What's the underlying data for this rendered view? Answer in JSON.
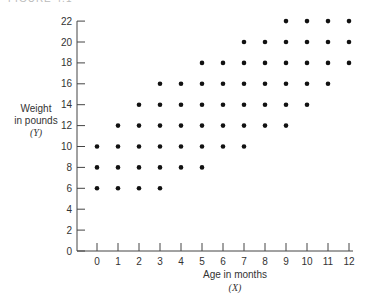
{
  "figure_label": "FIGURE 4.1",
  "chart_data": {
    "type": "scatter",
    "title": "",
    "xlabel": "Age in months",
    "xlabel_var": "(X)",
    "ylabel_lines": [
      "Weight",
      "in pounds",
      "(Y)"
    ],
    "x_ticks": [
      0,
      1,
      2,
      3,
      4,
      5,
      6,
      7,
      8,
      9,
      10,
      11,
      12
    ],
    "y_ticks": [
      0,
      2,
      4,
      6,
      8,
      10,
      12,
      14,
      16,
      18,
      20,
      22
    ],
    "xlim": [
      0,
      12
    ],
    "ylim": [
      0,
      22
    ],
    "grid": false,
    "legend": null,
    "columns": [
      {
        "x": 0,
        "y": [
          6,
          8,
          10
        ]
      },
      {
        "x": 1,
        "y": [
          6,
          8,
          10,
          12
        ]
      },
      {
        "x": 2,
        "y": [
          6,
          8,
          10,
          12,
          14
        ]
      },
      {
        "x": 3,
        "y": [
          6,
          8,
          10,
          12,
          14,
          16
        ]
      },
      {
        "x": 4,
        "y": [
          8,
          10,
          12,
          14,
          16
        ]
      },
      {
        "x": 5,
        "y": [
          8,
          10,
          12,
          14,
          16,
          18
        ]
      },
      {
        "x": 6,
        "y": [
          10,
          12,
          14,
          16,
          18
        ]
      },
      {
        "x": 7,
        "y": [
          10,
          12,
          14,
          16,
          18,
          20
        ]
      },
      {
        "x": 8,
        "y": [
          12,
          14,
          16,
          18,
          20
        ]
      },
      {
        "x": 9,
        "y": [
          12,
          14,
          16,
          18,
          20,
          22
        ]
      },
      {
        "x": 10,
        "y": [
          14,
          16,
          18,
          20,
          22
        ]
      },
      {
        "x": 11,
        "y": [
          16,
          18,
          20,
          22
        ]
      },
      {
        "x": 12,
        "y": [
          18,
          20,
          22
        ]
      }
    ],
    "point_color": "#111111",
    "axis_color": "#444444"
  }
}
